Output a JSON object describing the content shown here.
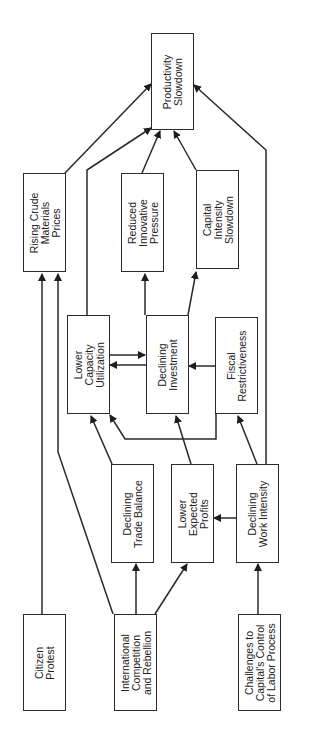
{
  "diagram": {
    "orientation": "rotated-90-ccw",
    "nodes": {
      "productivity": "Productivity\nSlowdown",
      "rising_crude": "Rising Crude\nMaterials\nPrices",
      "reduced_innovative": "Reduced\nInnovative\nPressure",
      "capital_intensity": "Capital\nIntensity\nSlowdown",
      "lower_capacity": "Lower\nCapacity\nUtilization",
      "declining_investment": "Declining\nInvestment",
      "fiscal": "Fiscal\nRestrictiveness",
      "trade_balance": "Declining\nTrade Balance",
      "expected_profits": "Lower\nExpected\nProfits",
      "work_intensity": "Declining\nWork Intensity",
      "citizen_protest": "Citizen\nProtest",
      "international": "International\nCompetition\nand Rebellion",
      "challenges": "Challenges to\nCapital's Control\nof Labor Process"
    },
    "edges": [
      [
        "Rising Crude Materials Prices",
        "Productivity Slowdown"
      ],
      [
        "Lower Capacity Utilization",
        "Productivity Slowdown"
      ],
      [
        "Reduced Innovative Pressure",
        "Productivity Slowdown"
      ],
      [
        "Capital Intensity Slowdown",
        "Productivity Slowdown"
      ],
      [
        "Declining Work Intensity",
        "Productivity Slowdown"
      ],
      [
        "Declining Investment",
        "Reduced Innovative Pressure"
      ],
      [
        "Declining Investment",
        "Capital Intensity Slowdown"
      ],
      [
        "Lower Capacity Utilization",
        "Declining Investment"
      ],
      [
        "Declining Investment",
        "Lower Capacity Utilization"
      ],
      [
        "Fiscal Restrictiveness",
        "Declining Investment"
      ],
      [
        "Fiscal Restrictiveness",
        "Lower Capacity Utilization"
      ],
      [
        "Declining Trade Balance",
        "Lower Capacity Utilization"
      ],
      [
        "Lower Expected Profits",
        "Declining Investment"
      ],
      [
        "Declining Work Intensity",
        "Fiscal Restrictiveness"
      ],
      [
        "Declining Work Intensity",
        "Lower Expected Profits"
      ],
      [
        "Citizen Protest",
        "Rising Crude Materials Prices"
      ],
      [
        "International Competition and Rebellion",
        "Rising Crude Materials Prices"
      ],
      [
        "International Competition and Rebellion",
        "Declining Trade Balance"
      ],
      [
        "International Competition and Rebellion",
        "Lower Expected Profits"
      ],
      [
        "Challenges to Capital's Control of Labor Process",
        "Declining Work Intensity"
      ]
    ]
  }
}
